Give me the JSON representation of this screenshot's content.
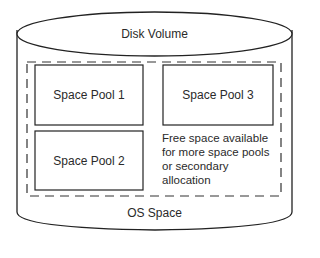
{
  "diagram": {
    "volume_label": "Disk Volume",
    "pools": [
      {
        "label": "Space Pool 1"
      },
      {
        "label": "Space Pool 2"
      },
      {
        "label": "Space Pool 3"
      }
    ],
    "free_space_lines": [
      "Free space available",
      "for more space pools",
      "or secondary",
      "allocation"
    ],
    "os_label": "OS Space"
  }
}
